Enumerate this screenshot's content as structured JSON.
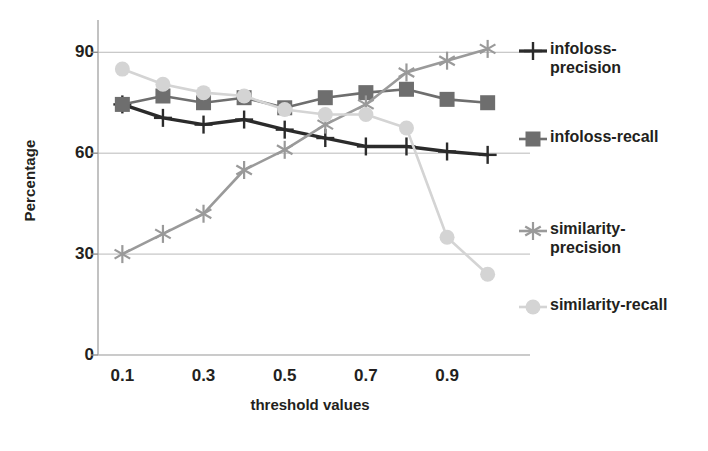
{
  "chart_data": {
    "type": "line",
    "title": "",
    "xlabel": "threshold values",
    "ylabel": "Percentage",
    "x": [
      0.1,
      0.2,
      0.3,
      0.4,
      0.5,
      0.6,
      0.7,
      0.8,
      0.9,
      1.0
    ],
    "xtick_labels": [
      "0.1",
      "0.3",
      "0.5",
      "0.7",
      "0.9"
    ],
    "xtick_values": [
      0.1,
      0.3,
      0.5,
      0.7,
      0.9
    ],
    "ytick_labels": [
      "0",
      "30",
      "60",
      "90"
    ],
    "ytick_values": [
      0,
      30,
      60,
      90
    ],
    "ylim": [
      0,
      99
    ],
    "xlim": [
      0.04,
      1.06
    ],
    "grid": "horizontal",
    "legend_position": "right",
    "series": [
      {
        "name": "infoloss-precision",
        "legend_label": "infoloss-\nprecision",
        "marker": "plus",
        "color": "#2b2b2b",
        "values": [
          74.5,
          70.5,
          68.5,
          70.0,
          67.0,
          64.5,
          62.0,
          62.0,
          60.5,
          59.5
        ]
      },
      {
        "name": "infoloss-recall",
        "legend_label": "infoloss-recall",
        "marker": "square",
        "color": "#6e6e6e",
        "values": [
          74.5,
          77.0,
          75.0,
          76.5,
          73.5,
          76.5,
          78.0,
          79.0,
          76.0,
          75.0
        ]
      },
      {
        "name": "similarity-precision",
        "legend_label": "similarity-\nprecision",
        "marker": "asterisk",
        "color": "#9a9a9a",
        "values": [
          30.0,
          36.0,
          42.0,
          55.0,
          61.0,
          68.5,
          74.5,
          84.0,
          87.5,
          91.0
        ]
      },
      {
        "name": "similarity-recall",
        "legend_label": "similarity-recall",
        "marker": "circle",
        "color": "#d4d4d4",
        "values": [
          85.0,
          80.5,
          78.0,
          77.0,
          73.0,
          71.5,
          71.5,
          67.5,
          35.0,
          24.0
        ]
      }
    ]
  }
}
